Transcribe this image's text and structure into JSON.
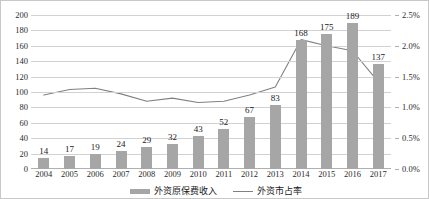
{
  "chart_data": {
    "type": "bar",
    "title": "",
    "xlabel": "",
    "ylabel": "",
    "grid": true,
    "legend_position": "bottom",
    "categories": [
      "2004",
      "2005",
      "2006",
      "2007",
      "2008",
      "2009",
      "2010",
      "2011",
      "2012",
      "2013",
      "2014",
      "2015",
      "2016",
      "2017"
    ],
    "y_left": {
      "label": "",
      "ylim": [
        0,
        200
      ],
      "tick_step": 20,
      "ticks": [
        "0",
        "20",
        "40",
        "60",
        "80",
        "100",
        "120",
        "140",
        "160",
        "180",
        "200"
      ]
    },
    "y_right": {
      "label": "",
      "ylim": [
        0,
        2.5
      ],
      "tick_step": 0.5,
      "ticks": [
        "0.0%",
        "0.5%",
        "1.0%",
        "1.5%",
        "2.0%",
        "2.5%"
      ]
    },
    "series": [
      {
        "name": "外资原保费收入",
        "type": "bar",
        "axis": "left",
        "color": "#a6a6a6",
        "values": [
          14,
          17,
          19,
          24,
          29,
          32,
          43,
          52,
          67,
          83,
          168,
          175,
          189,
          137
        ],
        "labels": [
          "14",
          "17",
          "19",
          "24",
          "29",
          "32",
          "43",
          "52",
          "67",
          "83",
          "168",
          "175",
          "189",
          "137"
        ]
      },
      {
        "name": "外资市占率",
        "type": "line",
        "axis": "right",
        "color": "#808080",
        "values": [
          1.2,
          1.29,
          1.31,
          1.22,
          1.1,
          1.15,
          1.08,
          1.1,
          1.2,
          1.33,
          2.1,
          2.0,
          1.92,
          1.42
        ]
      }
    ]
  },
  "legend": {
    "items": [
      {
        "label": "外资原保费收入",
        "marker": "bar-swatch"
      },
      {
        "label": "外资市占率",
        "marker": "line-swatch"
      }
    ]
  }
}
